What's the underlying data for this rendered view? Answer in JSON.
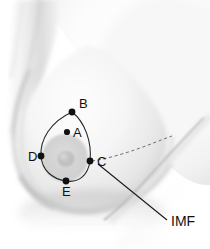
{
  "figure": {
    "background_color": "#ffffff",
    "skin_base_color": "#f4f4f4",
    "skin_shadow_color": "#c9c9c9",
    "outline_color": "#262626",
    "marker_color": "#111111",
    "dashed_line_color": "#6f6f6f"
  },
  "landmarks": [
    {
      "id": "A",
      "label": "A",
      "dot_x": 67,
      "dot_y": 132,
      "label_x": 73,
      "label_y": 137,
      "on_outline": false
    },
    {
      "id": "B",
      "label": "B",
      "dot_x": 72,
      "dot_y": 112,
      "label_x": 79,
      "label_y": 108,
      "on_outline": true
    },
    {
      "id": "C",
      "label": "C",
      "dot_x": 90,
      "dot_y": 161,
      "label_x": 97,
      "label_y": 166,
      "on_outline": true
    },
    {
      "id": "D",
      "label": "D",
      "dot_x": 41,
      "dot_y": 156,
      "label_x": 28,
      "label_y": 161,
      "on_outline": true
    },
    {
      "id": "E",
      "label": "E",
      "dot_x": 66,
      "dot_y": 181,
      "label_x": 62,
      "label_y": 196,
      "on_outline": true
    }
  ],
  "annotations": [
    {
      "id": "imf",
      "label": "IMF",
      "label_x": 171,
      "label_y": 226,
      "leader_from_x": 97,
      "leader_from_y": 163,
      "leader_to_x": 168,
      "leader_to_y": 221,
      "description": "inframammary-fold"
    }
  ],
  "icons": {
    "landmark_dot": "filled-circle-marker",
    "imf_leader": "leader-line",
    "imf_fold": "dashed-curve"
  }
}
